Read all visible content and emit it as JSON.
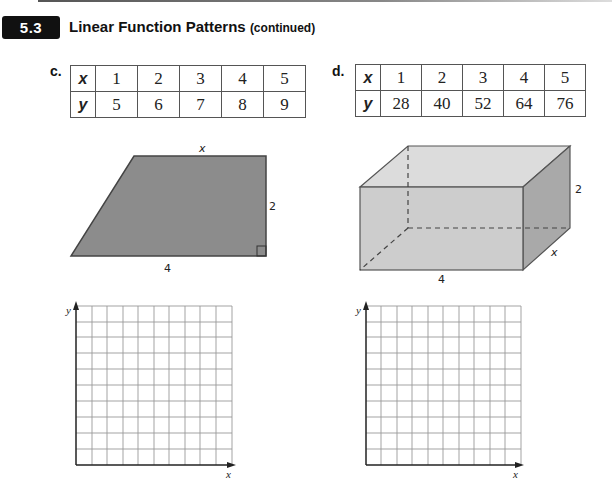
{
  "header": {
    "section_number": "5.3",
    "title": "Linear Function Patterns",
    "title_suffix": "(continued)"
  },
  "problems": [
    {
      "label": "c.",
      "table": {
        "row_headers": [
          "x",
          "y"
        ],
        "x": [
          "1",
          "2",
          "3",
          "4",
          "5"
        ],
        "y": [
          "5",
          "6",
          "7",
          "8",
          "9"
        ]
      },
      "figure": {
        "type": "trapezoid",
        "labels": {
          "top": "x",
          "right": "2",
          "bottom": "4"
        },
        "fill": "#8c8c8c"
      },
      "graph": {
        "x_label": "x",
        "y_label": "y",
        "columns": 10,
        "rows": 10
      }
    },
    {
      "label": "d.",
      "table": {
        "row_headers": [
          "x",
          "y"
        ],
        "x": [
          "1",
          "2",
          "3",
          "4",
          "5"
        ],
        "y": [
          "28",
          "40",
          "52",
          "64",
          "76"
        ]
      },
      "figure": {
        "type": "rectangular-prism",
        "labels": {
          "height": "2",
          "depth": "x",
          "length": "4"
        },
        "colors": {
          "front": "#c4c4c4",
          "top": "#dcdcdc",
          "side": "#a9a9a9"
        }
      },
      "graph": {
        "x_label": "x",
        "y_label": "y",
        "columns": 10,
        "rows": 10
      }
    }
  ]
}
